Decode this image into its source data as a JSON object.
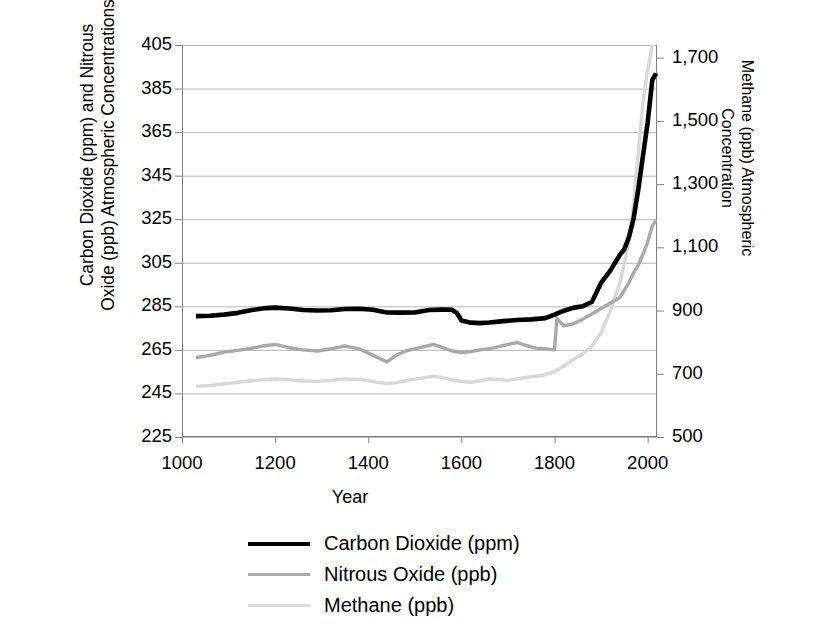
{
  "chart_data": {
    "type": "line",
    "title": "",
    "xlabel": "Year",
    "ylabel_left": [
      "Carbon Dioxide (ppm) and Nitrous",
      "Oxide (ppb) Atmospheric Concentrations"
    ],
    "ylabel_right": [
      "Methane (ppb) Atmospheric",
      "Concentration"
    ],
    "xlim": [
      1000,
      2020
    ],
    "xticks": [
      "1000",
      "1200",
      "1400",
      "1600",
      "1800",
      "2000"
    ],
    "xtick_values": [
      1000,
      1200,
      1400,
      1600,
      1800,
      2000
    ],
    "ylim_left": [
      225,
      405
    ],
    "yticks_left": [
      "405",
      "385",
      "365",
      "345",
      "325",
      "305",
      "285",
      "265",
      "245",
      "225"
    ],
    "ytick_values_left": [
      405,
      385,
      365,
      345,
      325,
      305,
      285,
      265,
      245,
      225
    ],
    "ylim_right": [
      500,
      1740
    ],
    "yticks_right": [
      "1,700",
      "1,500",
      "1,300",
      "1,100",
      "900",
      "700",
      "500"
    ],
    "ytick_values_right": [
      1700,
      1500,
      1300,
      1100,
      900,
      700,
      500
    ],
    "grid": true,
    "legend_position": "bottom-center",
    "colors": {
      "carbon_dioxide": "#000000",
      "nitrous_oxide": "#a9a9a9",
      "methane": "#d8d8d8",
      "grid": "#b7b7b7",
      "axis": "#808080",
      "background": "#ffffff"
    },
    "series": [
      {
        "name": "Carbon Dioxide (ppm)",
        "axis": "left",
        "unit": "ppm",
        "color": "#000000",
        "x": [
          1030,
          1060,
          1090,
          1120,
          1150,
          1180,
          1200,
          1230,
          1260,
          1290,
          1320,
          1350,
          1380,
          1410,
          1440,
          1470,
          1500,
          1530,
          1560,
          1580,
          1590,
          1600,
          1620,
          1640,
          1660,
          1690,
          1720,
          1750,
          1780,
          1800,
          1820,
          1840,
          1860,
          1880,
          1900,
          1920,
          1940,
          1950,
          1960,
          1970,
          1980,
          1990,
          2000,
          2010,
          2018
        ],
        "y": [
          280.5,
          280.7,
          281.2,
          282.0,
          283.3,
          284.2,
          284.4,
          284.0,
          283.3,
          283.1,
          283.2,
          283.8,
          283.9,
          283.4,
          282.2,
          282.1,
          282.2,
          283.3,
          283.5,
          283.4,
          282.0,
          278.5,
          277.5,
          277.3,
          277.6,
          278.2,
          278.7,
          279.0,
          279.6,
          281.2,
          283.0,
          284.3,
          285.0,
          287.0,
          295.8,
          301.5,
          308.5,
          311.3,
          316.9,
          325.7,
          338.8,
          354.4,
          369.5,
          389.0,
          392.0
        ]
      },
      {
        "name": "Nitrous Oxide (ppb)",
        "axis": "left",
        "unit": "ppb",
        "color": "#a9a9a9",
        "x": [
          1030,
          1060,
          1090,
          1120,
          1150,
          1180,
          1200,
          1230,
          1260,
          1290,
          1320,
          1350,
          1380,
          1400,
          1420,
          1440,
          1460,
          1480,
          1500,
          1520,
          1540,
          1560,
          1580,
          1600,
          1620,
          1640,
          1660,
          1680,
          1700,
          1720,
          1740,
          1760,
          1780,
          1800,
          1805,
          1820,
          1840,
          1860,
          1880,
          1900,
          1920,
          1940,
          1960,
          1970,
          1980,
          1990,
          2000,
          2010,
          2018
        ],
        "y": [
          261.5,
          262.5,
          264.0,
          264.8,
          265.8,
          267.0,
          267.5,
          266.0,
          265.0,
          264.5,
          265.5,
          266.8,
          265.5,
          263.5,
          261.5,
          259.5,
          262.5,
          264.5,
          265.5,
          266.5,
          267.5,
          266.0,
          264.5,
          263.8,
          264.2,
          265.0,
          265.5,
          266.5,
          267.5,
          268.3,
          267.0,
          265.8,
          265.5,
          265.0,
          279.5,
          276.0,
          277.0,
          279.0,
          281.5,
          284.0,
          286.5,
          289.0,
          296.0,
          300.5,
          304.0,
          309.0,
          314.5,
          322.0,
          324.5
        ]
      },
      {
        "name": "Methane (ppb)",
        "axis": "right",
        "unit": "ppb",
        "color": "#d8d8d8",
        "x": [
          1030,
          1060,
          1090,
          1120,
          1150,
          1180,
          1200,
          1230,
          1260,
          1290,
          1320,
          1350,
          1380,
          1400,
          1420,
          1440,
          1460,
          1480,
          1500,
          1520,
          1540,
          1560,
          1580,
          1600,
          1620,
          1640,
          1660,
          1680,
          1700,
          1720,
          1740,
          1760,
          1780,
          1800,
          1820,
          1840,
          1860,
          1880,
          1900,
          1920,
          1940,
          1950,
          1960,
          1970,
          1980,
          1990,
          2000,
          2010,
          2018
        ],
        "y": [
          660,
          663,
          668,
          673,
          678,
          682,
          684,
          681,
          677,
          676,
          679,
          684,
          682,
          678,
          673,
          669,
          672,
          678,
          683,
          688,
          692,
          688,
          681,
          676,
          673,
          678,
          684,
          682,
          679,
          684,
          689,
          692,
          697,
          707,
          724,
          745,
          762,
          788,
          830,
          900,
          985,
          1050,
          1120,
          1240,
          1400,
          1560,
          1660,
          1740,
          1750
        ]
      }
    ],
    "legend": [
      {
        "label": "Carbon Dioxide (ppm)",
        "color": "#000000",
        "width": 4.5
      },
      {
        "label": "Nitrous Oxide (ppb)",
        "color": "#a9a9a9",
        "width": 3.5
      },
      {
        "label": "Methane (ppb)",
        "color": "#d8d8d8",
        "width": 3.5
      }
    ]
  }
}
